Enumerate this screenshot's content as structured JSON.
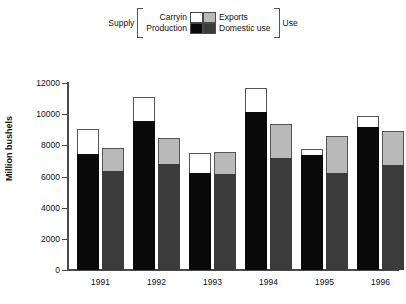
{
  "chart_data": {
    "type": "bar",
    "title": "",
    "subtitle": "",
    "xlabel": "",
    "ylabel": "Million bushels",
    "ylim": [
      0,
      12000
    ],
    "yticks": [
      0,
      2000,
      4000,
      6000,
      8000,
      10000,
      12000
    ],
    "ytick_labels": [
      "0",
      "2000",
      "4000",
      "6000",
      "8000",
      "10000",
      "12000"
    ],
    "grid": false,
    "legend_position": "top-center",
    "stacked": true,
    "grouped": true,
    "categories": [
      "1991",
      "1992",
      "1993",
      "1994",
      "1995",
      "1996"
    ],
    "group_labels": [
      "Supply",
      "Use"
    ],
    "series": [
      {
        "name": "Production",
        "group": "Supply",
        "stack_order": 1,
        "color": "#0a0a0a",
        "values": [
          7450,
          9550,
          6250,
          10150,
          7400,
          9200
        ]
      },
      {
        "name": "Carryin",
        "group": "Supply",
        "stack_order": 2,
        "color": "#ffffff",
        "values": [
          1600,
          1550,
          1250,
          1550,
          350,
          700
        ]
      },
      {
        "name": "Domestic use",
        "group": "Use",
        "stack_order": 1,
        "color": "#3b3b3b",
        "values": [
          6350,
          6800,
          6150,
          7200,
          6200,
          6750
        ]
      },
      {
        "name": "Exports",
        "group": "Use",
        "stack_order": 2,
        "color": "#b9b9b9",
        "values": [
          1450,
          1650,
          1450,
          2200,
          2400,
          2150
        ]
      }
    ],
    "totals": {
      "Supply": [
        9050,
        11100,
        7500,
        11700,
        7750,
        9900
      ],
      "Use": [
        7800,
        8450,
        7600,
        9400,
        8600,
        8900
      ]
    }
  },
  "legend": {
    "left_bracket_label": "Supply",
    "right_bracket_label": "Use",
    "top_left_name": "Carryin",
    "bottom_left_name": "Production",
    "top_right_name": "Exports",
    "bottom_right_name": "Domestic use",
    "colors": {
      "carryin": "#ffffff",
      "production": "#0a0a0a",
      "exports": "#b9b9b9",
      "domestic_use": "#3b3b3b"
    }
  },
  "axes": {
    "y_title": "Million bushels",
    "y_tick_labels": [
      "12000",
      "10000",
      "8000",
      "6000",
      "4000",
      "2000",
      "0"
    ],
    "x_tick_labels": [
      "1991",
      "1992",
      "1993",
      "1994",
      "1995",
      "1996"
    ]
  }
}
